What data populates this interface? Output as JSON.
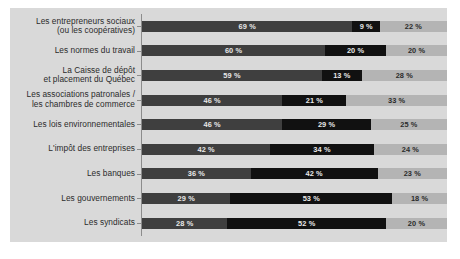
{
  "chart_data": {
    "type": "bar",
    "subtype": "stacked-horizontal-100",
    "title": "",
    "subtitle": "",
    "xlabel": "",
    "ylabel": "",
    "xlim": [
      0,
      100
    ],
    "grid": false,
    "legend_position": "none",
    "value_suffix": "%",
    "colors": {
      "series_1": "#3f3f3f",
      "series_2": "#111111",
      "series_3": "#b4b4b4",
      "panel_background": "#d9d9d9",
      "page_background": "#ffffff",
      "axis_line": "#8c8c8c",
      "label_text": "#2b2b2b"
    },
    "categories": [
      {
        "line1": "Les entrepreneurs sociaux",
        "line2": "(ou les coopératives)"
      },
      {
        "line1": "Les normes du travail",
        "line2": ""
      },
      {
        "line1": "La Caisse de dépôt",
        "line2": "et placement du Québec"
      },
      {
        "line1": "Les associations patronales /",
        "line2": "les chambres de commerce"
      },
      {
        "line1": "Les lois environnementales",
        "line2": ""
      },
      {
        "line1": "L'impôt des entreprises",
        "line2": ""
      },
      {
        "line1": "Les banques",
        "line2": ""
      },
      {
        "line1": "Les gouvernements",
        "line2": ""
      },
      {
        "line1": "Les syndicats",
        "line2": ""
      }
    ],
    "series": [
      {
        "name": "series_1",
        "values": [
          69,
          60,
          59,
          46,
          46,
          42,
          36,
          29,
          28
        ]
      },
      {
        "name": "series_2",
        "values": [
          9,
          20,
          13,
          21,
          29,
          34,
          42,
          53,
          52
        ]
      },
      {
        "name": "series_3",
        "values": [
          22,
          20,
          28,
          33,
          25,
          24,
          23,
          18,
          20
        ]
      }
    ],
    "rows": [
      {
        "category_line1": "Les entrepreneurs sociaux",
        "category_line2": "(ou les coopératives)",
        "segments": [
          {
            "value": 69,
            "label": "69 %"
          },
          {
            "value": 9,
            "label": "9 %"
          },
          {
            "value": 22,
            "label": "22 %"
          }
        ]
      },
      {
        "category_line1": "Les normes du travail",
        "category_line2": "",
        "segments": [
          {
            "value": 60,
            "label": "60 %"
          },
          {
            "value": 20,
            "label": "20 %"
          },
          {
            "value": 20,
            "label": "20 %"
          }
        ]
      },
      {
        "category_line1": "La Caisse de dépôt",
        "category_line2": "et placement du Québec",
        "segments": [
          {
            "value": 59,
            "label": "59 %"
          },
          {
            "value": 13,
            "label": "13 %"
          },
          {
            "value": 28,
            "label": "28 %"
          }
        ]
      },
      {
        "category_line1": "Les associations patronales /",
        "category_line2": "les chambres de commerce",
        "segments": [
          {
            "value": 46,
            "label": "46 %"
          },
          {
            "value": 21,
            "label": "21 %"
          },
          {
            "value": 33,
            "label": "33 %"
          }
        ]
      },
      {
        "category_line1": "Les lois environnementales",
        "category_line2": "",
        "segments": [
          {
            "value": 46,
            "label": "46 %"
          },
          {
            "value": 29,
            "label": "29 %"
          },
          {
            "value": 25,
            "label": "25 %"
          }
        ]
      },
      {
        "category_line1": "L'impôt des entreprises",
        "category_line2": "",
        "segments": [
          {
            "value": 42,
            "label": "42 %"
          },
          {
            "value": 34,
            "label": "34 %"
          },
          {
            "value": 24,
            "label": "24 %"
          }
        ]
      },
      {
        "category_line1": "Les banques",
        "category_line2": "",
        "segments": [
          {
            "value": 36,
            "label": "36 %"
          },
          {
            "value": 42,
            "label": "42 %"
          },
          {
            "value": 23,
            "label": "23 %"
          }
        ]
      },
      {
        "category_line1": "Les gouvernements",
        "category_line2": "",
        "segments": [
          {
            "value": 29,
            "label": "29 %"
          },
          {
            "value": 53,
            "label": "53 %"
          },
          {
            "value": 18,
            "label": "18 %"
          }
        ]
      },
      {
        "category_line1": "Les syndicats",
        "category_line2": "",
        "segments": [
          {
            "value": 28,
            "label": "28 %"
          },
          {
            "value": 52,
            "label": "52 %"
          },
          {
            "value": 20,
            "label": "20 %"
          }
        ]
      }
    ]
  }
}
